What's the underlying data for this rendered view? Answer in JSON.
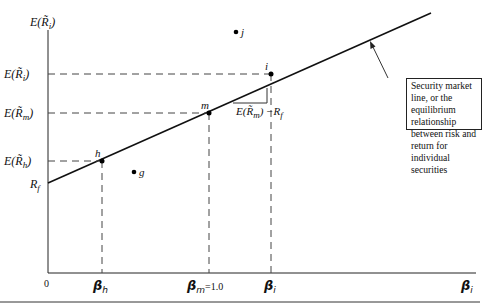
{
  "diagram": {
    "title": "Security market line",
    "y_axis_label": "E(R̃i)",
    "x_axis_label": "βi",
    "origin_label": "0",
    "y_ticks": [
      {
        "label": "E(R̃i)",
        "y": 74
      },
      {
        "label": "E(R̃m)",
        "y": 113
      },
      {
        "label": "E(R̃h)",
        "y": 161
      },
      {
        "label": "Rf",
        "y": 183
      }
    ],
    "x_ticks": [
      {
        "label": "βh",
        "x": 102
      },
      {
        "label": "βm=1.0",
        "x": 209
      },
      {
        "label": "βi",
        "x": 271
      }
    ],
    "points_on_line": [
      {
        "name": "h",
        "x": 102,
        "y": 161
      },
      {
        "name": "m",
        "x": 209,
        "y": 113
      },
      {
        "name": "i",
        "x": 271,
        "y": 74
      }
    ],
    "points_off_line": [
      {
        "name": "j",
        "x": 236,
        "y": 32
      },
      {
        "name": "g",
        "x": 134,
        "y": 172
      }
    ],
    "slope_label": "E(R̃m) − Rf",
    "annotation": "Security market line, or the equilibrium relationship between risk and return for individual securities"
  },
  "labels": {
    "y_axis_E": "E(",
    "R": "R̃",
    "i": "i",
    "m": "m",
    "h": "h",
    "f": "f",
    "close": ")",
    "beta": "β",
    "eq": "=1.0",
    "zero": "0",
    "pt_h": "h",
    "pt_m": "m",
    "pt_i": "i",
    "pt_j": "j",
    "pt_g": "g",
    "slope_pre": "E(",
    "slope_post": ") −R",
    "note_text": "Security market line, or the equilibrium relationship between risk and return for individual securities"
  }
}
